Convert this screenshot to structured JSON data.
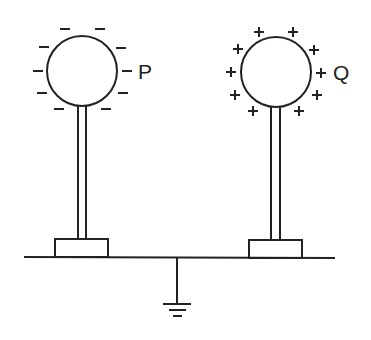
{
  "diagram": {
    "sphere_p": {
      "label": "P",
      "charge": "negative",
      "charge_symbol": "−",
      "charge_count": 10
    },
    "sphere_q": {
      "label": "Q",
      "charge": "positive",
      "charge_symbol": "+",
      "charge_count": 10
    },
    "ground": {
      "symbol": "earth-ground"
    },
    "colors": {
      "line": "#222222",
      "background": "#ffffff"
    }
  }
}
